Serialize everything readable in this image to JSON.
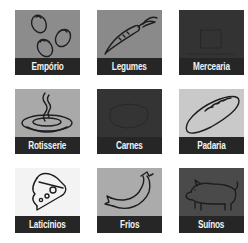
{
  "categories": [
    {
      "label": "Empório",
      "icon": "olives-icon",
      "bg": "#8c8c8c"
    },
    {
      "label": "Legumes",
      "icon": "carrot-icon",
      "bg": "#8a8a8a"
    },
    {
      "label": "Mercearia",
      "icon": "grocery-icon",
      "bg": "#333333"
    },
    {
      "label": "Rotisserie",
      "icon": "hot-dish-icon",
      "bg": "#a9a9a9"
    },
    {
      "label": "Carnes",
      "icon": "meat-icon",
      "bg": "#343434"
    },
    {
      "label": "Padaria",
      "icon": "bread-icon",
      "bg": "#c9c9c9"
    },
    {
      "label": "Laticínios",
      "icon": "cheese-icon",
      "bg": "#f3f3f3"
    },
    {
      "label": "Frios",
      "icon": "sausage-icon",
      "bg": "#ababab"
    },
    {
      "label": "Suínos",
      "icon": "pig-icon",
      "bg": "#4a4a4a"
    }
  ],
  "colors": {
    "label_band": "#262626",
    "label_text": "#f2f2f2",
    "icon_stroke": "#1e1e1e"
  }
}
